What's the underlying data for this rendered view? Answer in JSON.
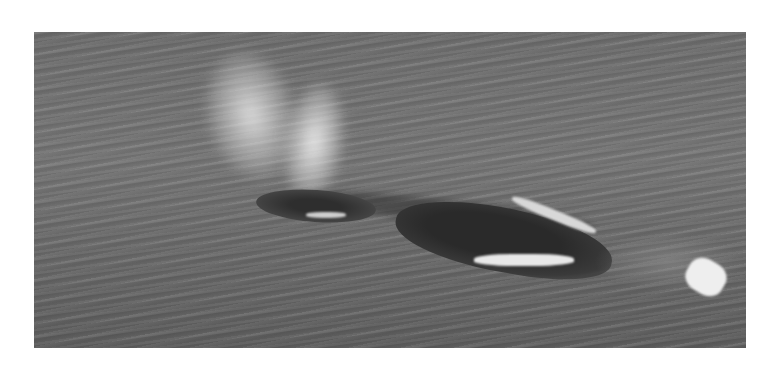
{
  "image": {
    "alt": "Aerial grayscale photograph of a whale surfacing and spouting in rippled ocean water",
    "subject": "whale",
    "elements": [
      "spout",
      "blowhole-head",
      "whale-back",
      "splashes",
      "wake"
    ],
    "tone": "grayscale",
    "background_color": "#ffffff",
    "water_color": "#6e6e6e"
  }
}
